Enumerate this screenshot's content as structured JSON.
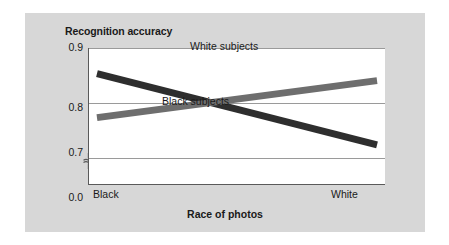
{
  "chart_data": {
    "type": "line",
    "title": "",
    "xlabel": "Race of photos",
    "ylabel": "Recognition accuracy",
    "categories": [
      "Black",
      "White"
    ],
    "x": [
      0,
      1
    ],
    "xtick_labels": [
      "Black",
      "White"
    ],
    "ytick_labels": [
      "0.9",
      "0.8",
      "0.7",
      "0.0"
    ],
    "ytick_values": [
      0.9,
      0.8,
      0.7,
      0.0
    ],
    "ylim": [
      0.65,
      0.9
    ],
    "y_axis_break": true,
    "y_axis_break_between": [
      0.0,
      0.7
    ],
    "grid": true,
    "grid_axis": "y",
    "legend": "inline-labels",
    "series": [
      {
        "name": "Black subjects",
        "values": [
          0.853,
          0.722
        ],
        "color": "#2e2e2e",
        "label_text": "Black subjects"
      },
      {
        "name": "White subjects",
        "values": [
          0.772,
          0.84
        ],
        "color": "#6e6e6e",
        "label_text": "White subjects"
      }
    ],
    "crossing_point": {
      "x": 0.5,
      "y": 0.8
    },
    "annotations": [
      "White subjects",
      "Black subjects"
    ]
  },
  "figure": {
    "background_color": "#d7d7d7",
    "plot_background_color": "#ffffff",
    "axis_color": "#5a5a5a",
    "gridline_color": "#9a9a9a"
  },
  "axes": {
    "y_title": "Recognition accuracy",
    "x_title": "Race of photos",
    "y_ticks": [
      {
        "label": "0.9"
      },
      {
        "label": "0.8"
      },
      {
        "label": "0.7"
      },
      {
        "label": "0.0"
      }
    ],
    "x_ticks": [
      {
        "label": "Black"
      },
      {
        "label": "White"
      }
    ]
  },
  "labels": {
    "white_subjects": "White subjects",
    "black_subjects": "Black subjects"
  }
}
